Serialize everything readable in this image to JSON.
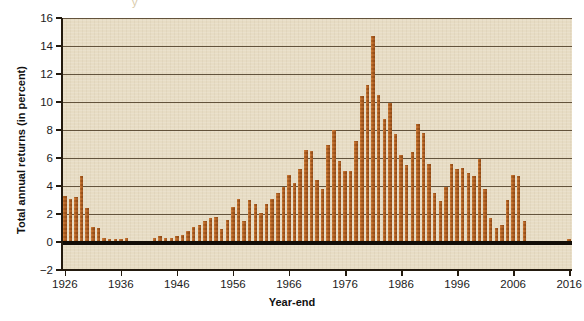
{
  "chart": {
    "axis_title_y": "Total annual returns (in percent)",
    "axis_title_x": "Year-end",
    "footnote": "",
    "top_artifact": "y"
  },
  "colors": {
    "bar": "#b5601f",
    "plot_background": "#e7dcc4",
    "gridline": "#4b3b25",
    "axis": "#231a0e",
    "zero_line": "#120d07",
    "page_background": "#ffffff"
  },
  "chart_data": {
    "type": "bar",
    "title": "",
    "subtitle": "",
    "xlabel": "Year-end",
    "ylabel": "Total annual returns (in percent)",
    "xlim": [
      1925.5,
      2016.5
    ],
    "ylim": [
      -2,
      16
    ],
    "ytick_values": [
      -2,
      0,
      2,
      4,
      6,
      8,
      10,
      12,
      14,
      16
    ],
    "ytick_labels": [
      "-2",
      "0",
      "2",
      "4",
      "6",
      "8",
      "10",
      "12",
      "14",
      "16"
    ],
    "xtick_values": [
      1926,
      1936,
      1946,
      1956,
      1966,
      1976,
      1986,
      1996,
      2006,
      2016
    ],
    "xtick_labels": [
      "1926",
      "1936",
      "1946",
      "1956",
      "1966",
      "1976",
      "1986",
      "1996",
      "2006",
      "2016"
    ],
    "grid": true,
    "grid_axis": "y",
    "legend": false,
    "legend_position": "none",
    "zero_line": true,
    "categories": [
      1926,
      1927,
      1928,
      1929,
      1930,
      1931,
      1932,
      1933,
      1934,
      1935,
      1936,
      1937,
      1938,
      1939,
      1940,
      1941,
      1942,
      1943,
      1944,
      1945,
      1946,
      1947,
      1948,
      1949,
      1950,
      1951,
      1952,
      1953,
      1954,
      1955,
      1956,
      1957,
      1958,
      1959,
      1960,
      1961,
      1962,
      1963,
      1964,
      1965,
      1966,
      1967,
      1968,
      1969,
      1970,
      1971,
      1972,
      1973,
      1974,
      1975,
      1976,
      1977,
      1978,
      1979,
      1980,
      1981,
      1982,
      1983,
      1984,
      1985,
      1986,
      1987,
      1988,
      1989,
      1990,
      1991,
      1992,
      1993,
      1994,
      1995,
      1996,
      1997,
      1998,
      1999,
      2000,
      2001,
      2002,
      2003,
      2004,
      2005,
      2006,
      2007,
      2008,
      2009,
      2010,
      2011,
      2012,
      2013,
      2014,
      2015,
      2016
    ],
    "values": [
      3.3,
      3.1,
      3.2,
      4.7,
      2.4,
      1.1,
      1.0,
      0.3,
      0.2,
      0.2,
      0.2,
      0.3,
      0.0,
      0.0,
      0.0,
      0.1,
      0.3,
      0.4,
      0.3,
      0.3,
      0.4,
      0.5,
      0.8,
      1.1,
      1.2,
      1.5,
      1.7,
      1.8,
      0.9,
      1.6,
      2.5,
      3.1,
      1.5,
      3.0,
      2.7,
      2.1,
      2.7,
      3.1,
      3.5,
      3.9,
      4.8,
      4.2,
      5.2,
      6.6,
      6.5,
      4.4,
      3.8,
      6.9,
      8.0,
      5.8,
      5.1,
      5.1,
      7.2,
      10.4,
      11.2,
      14.7,
      10.5,
      8.8,
      9.9,
      7.7,
      6.2,
      5.5,
      6.4,
      8.4,
      7.8,
      5.6,
      3.5,
      2.9,
      3.9,
      5.6,
      5.2,
      5.3,
      4.9,
      4.7,
      5.9,
      3.8,
      1.7,
      1.0,
      1.2,
      3.0,
      4.8,
      4.7,
      1.5,
      0.1,
      0.1,
      0.0,
      0.1,
      0.0,
      0.0,
      0.0,
      0.2
    ]
  }
}
